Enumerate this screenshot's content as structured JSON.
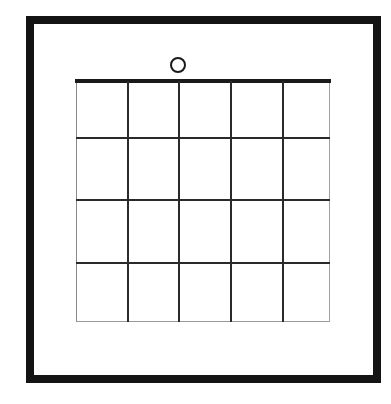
{
  "diagram": {
    "type": "grid-in-frame",
    "frame": {
      "color": "#141414"
    },
    "grid": {
      "columns": 5,
      "rows": 4,
      "top_edge": "thick",
      "line_color": "#2a2a2a"
    },
    "marker": {
      "shape": "circle",
      "position": "above top edge, above 3rd column line area",
      "color": "#1a1a1a"
    }
  }
}
